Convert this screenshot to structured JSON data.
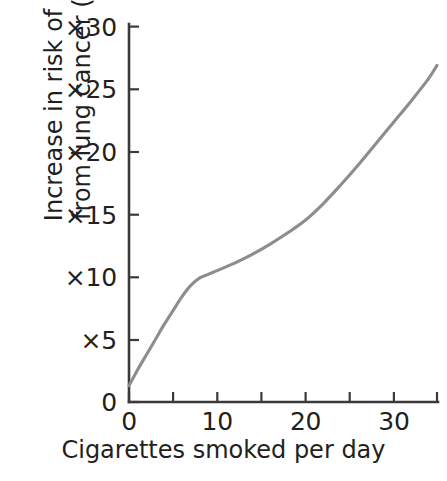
{
  "chart_data": {
    "type": "line",
    "title": "",
    "xlabel": "Cigarettes smoked per day",
    "ylabel_line1": "Increase in risk of dying",
    "ylabel_line2": "from lung cancer (men)",
    "xlim": [
      0,
      35
    ],
    "ylim": [
      0,
      30
    ],
    "grid": false,
    "legend": "none",
    "x_ticks": [
      0,
      5,
      10,
      15,
      20,
      25,
      30,
      35
    ],
    "x_tick_labels": [
      "0",
      "",
      "10",
      "",
      "20",
      "",
      "30",
      ""
    ],
    "y_ticks": [
      0,
      5,
      10,
      15,
      20,
      25,
      30
    ],
    "y_tick_labels": [
      "0",
      "×5",
      "×10",
      "×15",
      "×20",
      "×25",
      "×30"
    ],
    "series": [
      {
        "name": "Relative risk of dying from lung cancer (men)",
        "color": "#8d8d8d",
        "x": [
          0,
          1,
          2,
          3,
          4,
          5,
          6,
          7,
          8,
          9,
          10,
          12,
          14,
          16,
          18,
          20,
          22,
          24,
          26,
          28,
          30,
          32,
          34,
          35
        ],
        "y": [
          1.3,
          2.6,
          3.8,
          5.0,
          6.2,
          7.3,
          8.4,
          9.3,
          9.9,
          10.2,
          10.5,
          11.1,
          11.8,
          12.6,
          13.5,
          14.5,
          15.8,
          17.3,
          18.9,
          20.6,
          22.3,
          24.0,
          25.8,
          26.9
        ]
      }
    ]
  },
  "axes": {
    "x_axis_name": "cigarettes-per-day-axis",
    "y_axis_name": "relative-risk-axis"
  }
}
